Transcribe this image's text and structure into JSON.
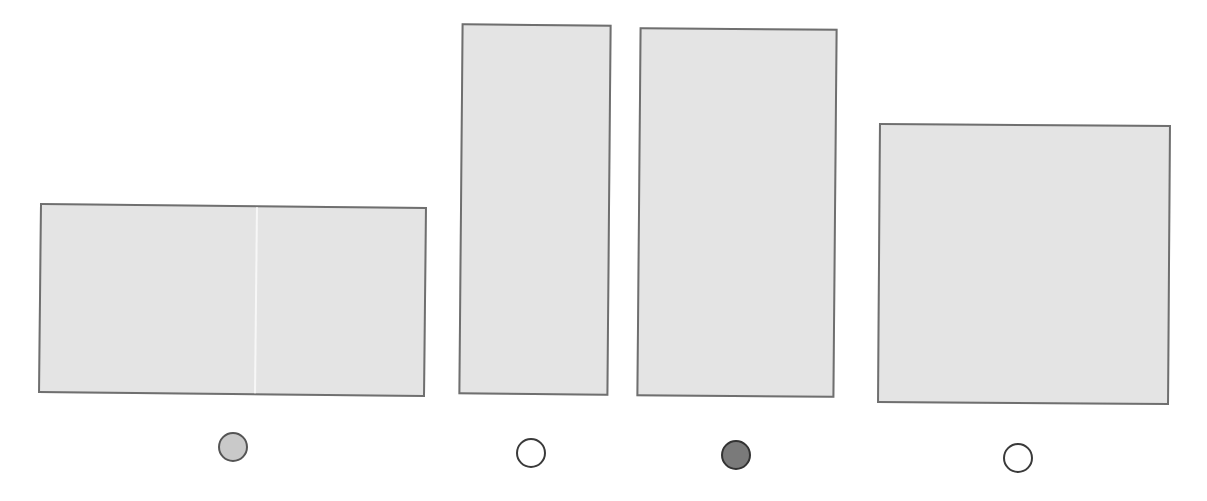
{
  "worksheet": {
    "options": [
      {
        "id": "a",
        "shape": "rectangle",
        "divided": true,
        "box": {
          "left": 39,
          "top": 205,
          "width": 387,
          "height": 190,
          "rotate": 0.6
        },
        "bubble": {
          "left": 218,
          "top": 432,
          "state": "light"
        }
      },
      {
        "id": "b",
        "shape": "rectangle",
        "divided": false,
        "box": {
          "left": 460,
          "top": 24,
          "width": 150,
          "height": 371,
          "rotate": 0.5
        },
        "bubble": {
          "left": 516,
          "top": 438,
          "state": "empty"
        }
      },
      {
        "id": "c",
        "shape": "rectangle",
        "divided": false,
        "box": {
          "left": 638,
          "top": 28,
          "width": 198,
          "height": 369,
          "rotate": 0.5
        },
        "bubble": {
          "left": 721,
          "top": 440,
          "state": "dark"
        }
      },
      {
        "id": "d",
        "shape": "square",
        "divided": false,
        "box": {
          "left": 878,
          "top": 124,
          "width": 292,
          "height": 280,
          "rotate": 0.4
        },
        "bubble": {
          "left": 1003,
          "top": 443,
          "state": "empty"
        }
      }
    ],
    "selected_option": "c",
    "colors": {
      "fill": "#e4e4e4",
      "border": "#6f6f6f",
      "bubble_dark": "#7a7a7a",
      "bubble_light": "#c9c9c9"
    }
  }
}
